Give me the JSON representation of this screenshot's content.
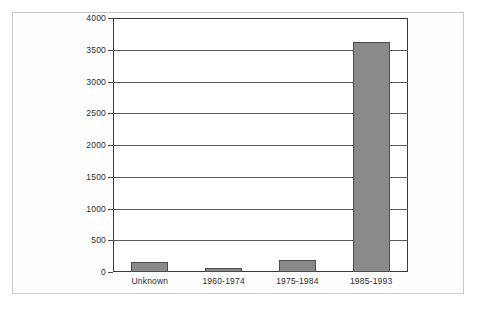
{
  "chart_data": {
    "type": "bar",
    "title": "",
    "subtitle": "",
    "xlabel": "",
    "ylabel": "",
    "categories": [
      "Unknown",
      "1960-1974",
      "1975-1984",
      "1985-1993"
    ],
    "values": [
      150,
      70,
      190,
      3630
    ],
    "series": [
      {
        "name": "Count",
        "values": [
          150,
          70,
          190,
          3630
        ]
      }
    ],
    "ylim": [
      0,
      4000
    ],
    "ytick_labels": [
      "0",
      "500",
      "1000",
      "1500",
      "2000",
      "2500",
      "3000",
      "3500",
      "4000"
    ],
    "ytick_values": [
      0,
      500,
      1000,
      1500,
      2000,
      2500,
      3000,
      3500,
      4000
    ],
    "grid": true,
    "grid_axis": "y",
    "legend": false,
    "legend_position": "none",
    "annotations": [],
    "bar_color": "#8a8a8a",
    "bar_edge_color": "#4d4d4d",
    "axis_color": "#3a3a3a",
    "gridline_color": "#5a5a5a",
    "background_color": "#ffffff",
    "frame_color": "#c9c9c9",
    "text_color": "#2b2b2b"
  }
}
